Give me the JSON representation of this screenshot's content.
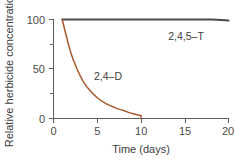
{
  "chart_data": {
    "type": "line",
    "title": "",
    "xlabel": "Time (days)",
    "ylabel": "Relative herbicide concentration",
    "xlim": [
      0,
      20
    ],
    "ylim": [
      0,
      100
    ],
    "xticks": [
      0,
      5,
      10,
      15,
      20
    ],
    "xtick_labels": [
      "0",
      "5",
      "10",
      "15",
      "20"
    ],
    "yticks": [
      0,
      50,
      100
    ],
    "ytick_labels": [
      "0",
      "50",
      "100"
    ],
    "yminor_ticks": [
      25,
      75
    ],
    "grid": false,
    "legend": "inline-labels",
    "series": [
      {
        "name": "2,4,5–T",
        "color": "#4a4a4a",
        "label_text": "2,4,5–T",
        "x": [
          1,
          2,
          4,
          6,
          8,
          10,
          12,
          14,
          16,
          18,
          20
        ],
        "values": [
          100,
          100,
          100,
          100,
          100,
          100,
          100,
          100,
          100,
          100,
          99
        ]
      },
      {
        "name": "2,4–D",
        "color": "#a85a2a",
        "label_text": "2,4–D",
        "x": [
          1,
          1.5,
          2,
          2.5,
          3,
          3.5,
          4,
          5,
          6,
          7,
          8,
          9,
          10
        ],
        "values": [
          100,
          82,
          66,
          54,
          44,
          36,
          30,
          21,
          15,
          11,
          8,
          5,
          3
        ]
      }
    ]
  },
  "labels": {
    "y_axis_title": "Relative herbicide concentration",
    "x_axis_title": "Time (days)",
    "series_t_label": "2,4,5–T",
    "series_d_label": "2,4–D",
    "x0": "0",
    "x5": "5",
    "x10": "10",
    "x15": "15",
    "x20": "20",
    "y0": "0",
    "y50": "50",
    "y100": "100"
  },
  "colors": {
    "series_t": "#4a4a4a",
    "series_d": "#a85a2a",
    "axis": "#5d5d5d",
    "text": "#3d3d3d",
    "background": "#ffffff"
  }
}
